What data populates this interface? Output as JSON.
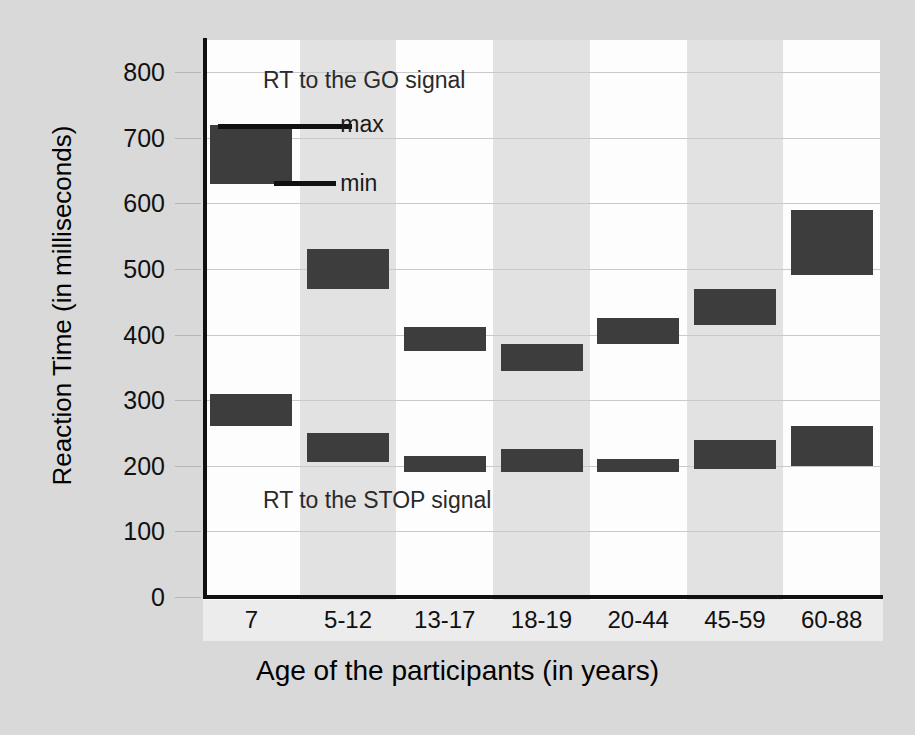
{
  "chart_data": {
    "type": "bar",
    "title": "",
    "xlabel": "Age of the participants (in years)",
    "ylabel": "Reaction Time (in milliseconds)",
    "ylim": [
      0,
      800
    ],
    "ytick_labels": [
      "800",
      "700",
      "600",
      "500",
      "400",
      "300",
      "200",
      "100",
      "0"
    ],
    "ytick_values": [
      800,
      700,
      600,
      500,
      400,
      300,
      200,
      100,
      0
    ],
    "grid": true,
    "legend_position": "inside-top-left",
    "categories": [
      "7",
      "5-12",
      "13-17",
      "18-19",
      "20-44",
      "45-59",
      "60-88"
    ],
    "annotations": [
      {
        "text": "RT to the GO signal",
        "x_category": "7",
        "y": 790
      },
      {
        "text": "RT to the STOP signal",
        "x_category": "7",
        "y": 150
      }
    ],
    "legend": {
      "max_label": "max",
      "min_label": "min",
      "swatch_max": 720,
      "swatch_min": 630
    },
    "series": [
      {
        "name": "RT to the GO signal",
        "range_type": "min-max",
        "min": [
          630,
          470,
          375,
          345,
          385,
          415,
          490
        ],
        "max": [
          720,
          530,
          412,
          385,
          425,
          470,
          590
        ]
      },
      {
        "name": "RT to the STOP signal",
        "range_type": "min-max",
        "min": [
          260,
          205,
          190,
          190,
          190,
          195,
          200
        ],
        "max": [
          310,
          250,
          215,
          225,
          210,
          240,
          260
        ]
      }
    ],
    "colors": {
      "bar": "#3d3d3d",
      "axis": "#111111",
      "grid": "#c9c9c9",
      "plot_background": "#fdfdfd",
      "band_alt": "#e2e2e2",
      "figure_background": "#d9d9d9"
    }
  }
}
